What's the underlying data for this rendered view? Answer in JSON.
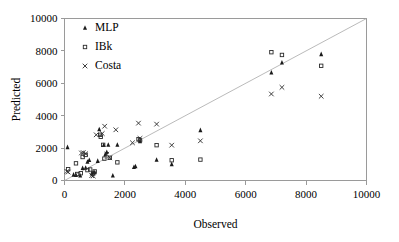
{
  "chart_data": {
    "type": "scatter",
    "title": "",
    "xlabel": "Observed",
    "ylabel": "Predicted",
    "xlim": [
      0,
      10000
    ],
    "ylim": [
      0,
      10000
    ],
    "xticks": [
      0,
      2000,
      4000,
      6000,
      8000,
      10000
    ],
    "yticks": [
      0,
      2000,
      4000,
      6000,
      8000,
      10000
    ],
    "xtick_labels": [
      "0",
      "2000",
      "4000",
      "6000",
      "8000",
      "10000"
    ],
    "ytick_labels": [
      "0",
      "2000",
      "4000",
      "6000",
      "8000",
      "10000"
    ],
    "grid": false,
    "legend_position": "top-left",
    "reference_line": {
      "name": "1:1 identity line",
      "from": [
        0,
        0
      ],
      "to": [
        10000,
        10000
      ]
    },
    "series": [
      {
        "name": "MLP",
        "marker": "filled-triangle",
        "color": "#1a1a1a",
        "points": [
          [
            100,
            2050
          ],
          [
            300,
            350
          ],
          [
            380,
            330
          ],
          [
            520,
            300
          ],
          [
            600,
            760
          ],
          [
            700,
            780
          ],
          [
            760,
            1150
          ],
          [
            820,
            1250
          ],
          [
            900,
            430
          ],
          [
            950,
            480
          ],
          [
            1000,
            500
          ],
          [
            1100,
            1200
          ],
          [
            1150,
            3150
          ],
          [
            1300,
            2180
          ],
          [
            1350,
            1600
          ],
          [
            1400,
            1750
          ],
          [
            1450,
            2200
          ],
          [
            1600,
            300
          ],
          [
            1750,
            2200
          ],
          [
            2300,
            820
          ],
          [
            2350,
            870
          ],
          [
            2500,
            2420
          ],
          [
            3050,
            1270
          ],
          [
            3550,
            1000
          ],
          [
            4500,
            3100
          ],
          [
            6850,
            6650
          ],
          [
            7200,
            7270
          ],
          [
            8500,
            7790
          ]
        ]
      },
      {
        "name": "IBk",
        "marker": "open-square",
        "color": "#2b2b2b",
        "points": [
          [
            120,
            700
          ],
          [
            380,
            1060
          ],
          [
            420,
            400
          ],
          [
            540,
            450
          ],
          [
            600,
            1450
          ],
          [
            700,
            1580
          ],
          [
            760,
            640
          ],
          [
            850,
            680
          ],
          [
            950,
            430
          ],
          [
            1000,
            560
          ],
          [
            1180,
            2820
          ],
          [
            1200,
            2700
          ],
          [
            1280,
            2200
          ],
          [
            1320,
            1350
          ],
          [
            1500,
            1400
          ],
          [
            1750,
            1120
          ],
          [
            2450,
            2550
          ],
          [
            2500,
            2480
          ],
          [
            3050,
            2180
          ],
          [
            3550,
            1250
          ],
          [
            4500,
            1290
          ],
          [
            6850,
            7920
          ],
          [
            7200,
            7750
          ],
          [
            8500,
            7080
          ]
        ]
      },
      {
        "name": "Costa",
        "marker": "cross-x",
        "color": "#2b2b2b",
        "points": [
          [
            80,
            560
          ],
          [
            120,
            520
          ],
          [
            560,
            1700
          ],
          [
            620,
            1720
          ],
          [
            700,
            1650
          ],
          [
            900,
            300
          ],
          [
            950,
            280
          ],
          [
            1050,
            2820
          ],
          [
            1250,
            2900
          ],
          [
            1330,
            3350
          ],
          [
            1400,
            1620
          ],
          [
            1500,
            1400
          ],
          [
            1700,
            3130
          ],
          [
            2250,
            2330
          ],
          [
            2500,
            2600
          ],
          [
            2450,
            3540
          ],
          [
            3050,
            3480
          ],
          [
            3550,
            2180
          ],
          [
            4500,
            2450
          ],
          [
            6850,
            5340
          ],
          [
            7200,
            5750
          ],
          [
            8500,
            5200
          ]
        ]
      }
    ]
  },
  "legend": {
    "entries": [
      {
        "label": "MLP",
        "marker": "filled-triangle"
      },
      {
        "label": "IBk",
        "marker": "open-square"
      },
      {
        "label": "Costa",
        "marker": "cross-x"
      }
    ]
  }
}
